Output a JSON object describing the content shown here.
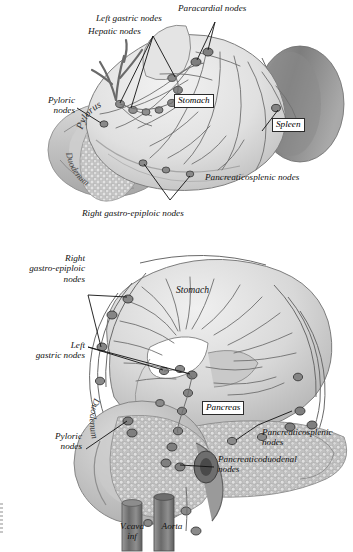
{
  "document": {
    "type": "anatomical-illustration",
    "subject": "Lymphatic drainage of the stomach, duodenum, pancreas and spleen",
    "style": "greyscale medical line drawing",
    "background": "#ffffff",
    "figure_count": 2
  },
  "palette": {
    "background": "#ffffff",
    "stomach_light": "#e9e9e9",
    "stomach_mid": "#d2d2d2",
    "stomach_shadow": "#b4b4b4",
    "spleen_dark": "#8f8f8f",
    "spleen_darker": "#6f6f6f",
    "duodenum": "#c4c4c4",
    "pancreas": "#bdbdbd",
    "vessel": "#6b6b6b",
    "node_fill": "#8a8a8a",
    "node_stroke": "#3a3a3a",
    "leader_line": "#111111",
    "text": "#111111",
    "label_box_border": "#2b2b2b"
  },
  "figure_top": {
    "name": "anterior-view-stomach-lymph-nodes",
    "organ_labels": [
      {
        "id": "stomach",
        "text": "Stomach",
        "boxed": true
      },
      {
        "id": "spleen",
        "text": "Spleen",
        "boxed": true
      },
      {
        "id": "pylorus",
        "text": "Pylorus",
        "boxed": false,
        "curved": true
      },
      {
        "id": "duodenum",
        "text": "Duodenum",
        "boxed": false,
        "curved": true
      }
    ],
    "node_labels": [
      {
        "id": "paracardial",
        "lines": [
          "Paracardial nodes"
        ],
        "align": "left"
      },
      {
        "id": "left-gastric",
        "lines": [
          "Left gastric nodes"
        ],
        "align": "left"
      },
      {
        "id": "hepatic",
        "lines": [
          "Hepatic nodes"
        ],
        "align": "left"
      },
      {
        "id": "pyloric",
        "lines": [
          "Pyloric",
          "nodes"
        ],
        "align": "center"
      },
      {
        "id": "pancreaticosplenic",
        "lines": [
          "Pancreaticosplenic nodes"
        ],
        "align": "left"
      },
      {
        "id": "right-gastro-epiploic",
        "lines": [
          "Right gastro-epiploic nodes"
        ],
        "align": "left"
      }
    ]
  },
  "figure_bottom": {
    "name": "posterior-view-stomach-pancreas-lymph-nodes",
    "organ_labels": [
      {
        "id": "stomach",
        "text": "Stomach",
        "boxed": false
      },
      {
        "id": "pancreas",
        "text": "Pancreas",
        "boxed": true
      },
      {
        "id": "duodenum",
        "text": "Duodenum",
        "boxed": false,
        "curved": true
      }
    ],
    "node_labels": [
      {
        "id": "right-gastro-epiploic",
        "lines": [
          "Right",
          "gastro-epiploic",
          "nodes"
        ],
        "align": "right"
      },
      {
        "id": "left-gastric",
        "lines": [
          "Left",
          "gastric nodes"
        ],
        "align": "right"
      },
      {
        "id": "pyloric",
        "lines": [
          "Pyloric",
          "nodes"
        ],
        "align": "center"
      },
      {
        "id": "pancreaticosplenic",
        "lines": [
          "Pancreaticosplenic",
          "nodes"
        ],
        "align": "left"
      },
      {
        "id": "pancreaticoduodenal",
        "lines": [
          "Pancreaticoduodenal",
          "nodes"
        ],
        "align": "left"
      }
    ],
    "vessel_labels": [
      {
        "id": "vena-cava",
        "lines": [
          "V.cava",
          "inf"
        ],
        "align": "center"
      },
      {
        "id": "aorta",
        "lines": [
          "Aorta"
        ],
        "align": "center"
      }
    ]
  }
}
